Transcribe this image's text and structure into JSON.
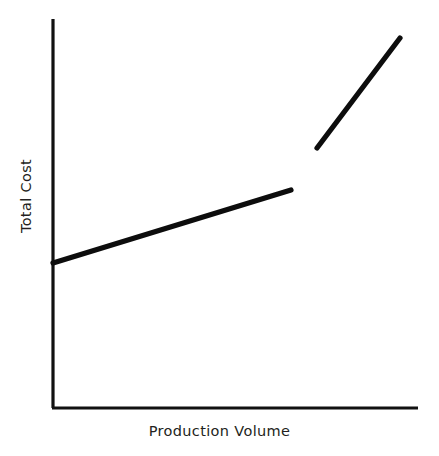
{
  "figure": {
    "width": 439,
    "height": 456,
    "background_color": "#ffffff",
    "line_color": "#0d0d0d",
    "axis_color": "#111111",
    "text_color": "#231f20"
  },
  "chart_data": {
    "type": "line",
    "title": "",
    "subtitle": "",
    "xlabel": "Production Volume",
    "ylabel": "Total Cost",
    "xlim": [
      0,
      100
    ],
    "ylim": [
      0,
      100
    ],
    "grid": false,
    "legend": null,
    "legend_position": "none",
    "x_tick_labels": [],
    "y_tick_labels": [],
    "annotations": [],
    "series": [
      {
        "name": "Relevant range segment 1",
        "points": [
          {
            "x": 0.0,
            "y": 37.4
          },
          {
            "x": 65.2,
            "y": 56.1
          }
        ]
      },
      {
        "name": "Relevant range segment 2",
        "points": [
          {
            "x": 72.3,
            "y": 66.9
          },
          {
            "x": 95.1,
            "y": 95.1
          }
        ]
      }
    ],
    "axes_pixels": {
      "y_axis_x": 53,
      "y_axis_top_y": 19,
      "x_axis_y": 408,
      "x_axis_right_x": 418
    },
    "series_pixels": [
      {
        "x1": 53,
        "y1": 263,
        "x2": 291,
        "y2": 190
      },
      {
        "x1": 317,
        "y1": 148,
        "x2": 400,
        "y2": 38
      }
    ]
  }
}
